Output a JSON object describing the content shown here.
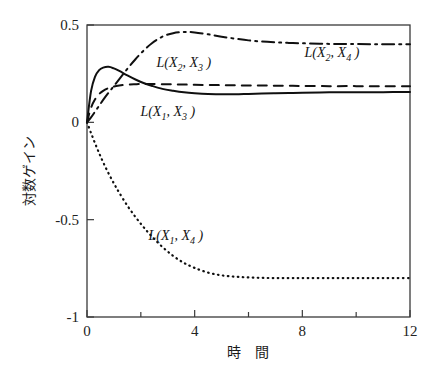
{
  "chart_data": {
    "type": "line",
    "title": "",
    "xlabel": "時　間",
    "ylabel": "対数ゲイン",
    "xlim": [
      0,
      12
    ],
    "ylim": [
      -1,
      0.5
    ],
    "grid": false,
    "legend_position": "inline-annotations",
    "x_ticks": [
      {
        "value": 0,
        "label": "0",
        "major": true
      },
      {
        "value": 2,
        "label": "",
        "major": false
      },
      {
        "value": 4,
        "label": "4",
        "major": true
      },
      {
        "value": 6,
        "label": "",
        "major": false
      },
      {
        "value": 8,
        "label": "8",
        "major": true
      },
      {
        "value": 10,
        "label": "",
        "major": false
      },
      {
        "value": 12,
        "label": "12",
        "major": true
      }
    ],
    "y_ticks": [
      {
        "value": 0.5,
        "label": "0.5",
        "major": true
      },
      {
        "value": 0,
        "label": "0",
        "major": true
      },
      {
        "value": -0.5,
        "label": "-0.5",
        "major": true
      },
      {
        "value": -1,
        "label": "-1",
        "major": true
      }
    ],
    "x": [
      0,
      0.15,
      0.3,
      0.45,
      0.6,
      0.8,
      1.0,
      1.2,
      1.5,
      1.8,
      2.1,
      2.4,
      2.8,
      3.2,
      3.6,
      4.0,
      4.5,
      5.0,
      5.5,
      6.0,
      6.5,
      7.0,
      7.5,
      8.0,
      9.0,
      10.0,
      11.0,
      12.0
    ],
    "series": [
      {
        "name": "L(X1, X3)",
        "label_main": "L(X",
        "label_sub1": "1",
        "label_mid": ", X",
        "label_sub2": "3",
        "label_end": " )",
        "style": "solid",
        "color": "#101010",
        "label_x": 3.0,
        "label_y": 0.03,
        "values": [
          0.0,
          0.16,
          0.235,
          0.268,
          0.281,
          0.285,
          0.277,
          0.264,
          0.241,
          0.22,
          0.202,
          0.188,
          0.172,
          0.162,
          0.154,
          0.149,
          0.145,
          0.144,
          0.144,
          0.146,
          0.148,
          0.15,
          0.151,
          0.152,
          0.154,
          0.155,
          0.155,
          0.156
        ]
      },
      {
        "name": "L(X2, X3)",
        "label_main": "L(X",
        "label_sub1": "2",
        "label_mid": ", X",
        "label_sub2": "3",
        "label_end": " )",
        "style": "dashed",
        "color": "#101010",
        "label_x": 3.6,
        "label_y": 0.285,
        "values": [
          0.0,
          0.075,
          0.118,
          0.145,
          0.162,
          0.176,
          0.184,
          0.189,
          0.194,
          0.196,
          0.197,
          0.197,
          0.196,
          0.195,
          0.194,
          0.193,
          0.192,
          0.191,
          0.19,
          0.189,
          0.189,
          0.188,
          0.188,
          0.187,
          0.186,
          0.186,
          0.185,
          0.185
        ]
      },
      {
        "name": "L(X2, X4)",
        "label_main": "L(X",
        "label_sub1": "2",
        "label_mid": ", X",
        "label_sub2": "4",
        "label_end": " )",
        "style": "dashdot",
        "color": "#101010",
        "label_x": 9.1,
        "label_y": 0.335,
        "values": [
          0.0,
          0.025,
          0.055,
          0.085,
          0.115,
          0.152,
          0.187,
          0.222,
          0.275,
          0.324,
          0.368,
          0.405,
          0.44,
          0.458,
          0.464,
          0.462,
          0.452,
          0.44,
          0.43,
          0.421,
          0.415,
          0.411,
          0.408,
          0.406,
          0.403,
          0.402,
          0.401,
          0.401
        ]
      },
      {
        "name": "L(X1, X4)",
        "label_main": "L(X",
        "label_sub1": "1",
        "label_mid": ", X",
        "label_sub2": "4",
        "label_end": " )",
        "style": "dotted",
        "color": "#101010",
        "label_x": 3.3,
        "label_y": -0.605,
        "values": [
          0.0,
          -0.055,
          -0.108,
          -0.158,
          -0.205,
          -0.262,
          -0.314,
          -0.362,
          -0.428,
          -0.486,
          -0.538,
          -0.585,
          -0.64,
          -0.686,
          -0.722,
          -0.748,
          -0.772,
          -0.786,
          -0.793,
          -0.797,
          -0.799,
          -0.8,
          -0.8,
          -0.8,
          -0.8,
          -0.8,
          -0.8,
          -0.8
        ]
      }
    ]
  }
}
